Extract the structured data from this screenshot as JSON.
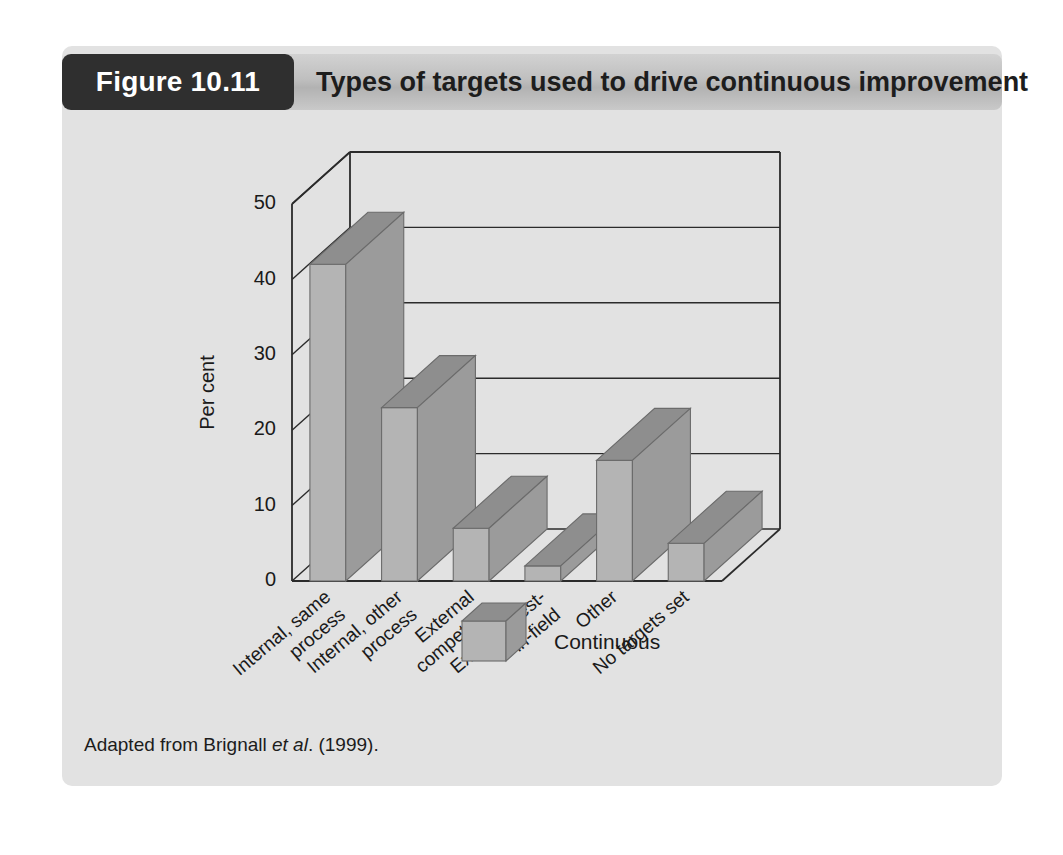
{
  "figure": {
    "badge_label": "Figure 10.11",
    "title": "Types of targets used to drive continuous improvement",
    "source_prefix": "Adapted from Brignall ",
    "source_italic": "et al",
    "source_suffix": ". (1999)."
  },
  "colors": {
    "page_background": "#ffffff",
    "panel_background": "#e2e2e2",
    "badge_background": "#2f2f2f",
    "badge_text": "#ffffff",
    "header_bar": "#c0c0c0",
    "bar_front": "#b4b4b4",
    "bar_top": "#8e8e8e",
    "bar_side": "#9b9b9b",
    "bar_outline": "#6b6b6b",
    "axis_line": "#2b2b2b",
    "gridline": "#2b2b2b",
    "text": "#1a1a1a"
  },
  "chart_data": {
    "type": "bar",
    "title": "Types of targets used to drive continuous improvement",
    "xlabel": "",
    "ylabel": "Per cent",
    "ylim": [
      0,
      50
    ],
    "ytick_step": 10,
    "yticks": [
      "0",
      "10",
      "20",
      "30",
      "40",
      "50"
    ],
    "grid": true,
    "three_d": true,
    "legend_position": "bottom-center",
    "categories": [
      "Internal, same process",
      "Internal, other process",
      "External competitor",
      "External best-in-field",
      "Other",
      "No targets set"
    ],
    "category_lines": [
      [
        "Internal, same",
        "process"
      ],
      [
        "Internal, other",
        "process"
      ],
      [
        "External",
        "competitor"
      ],
      [
        "External best-",
        "in-field"
      ],
      [
        "Other"
      ],
      [
        "No targets set"
      ]
    ],
    "series": [
      {
        "name": "Continuous",
        "values": [
          42,
          23,
          7,
          2,
          16,
          5
        ]
      }
    ]
  },
  "legend": {
    "entries": [
      {
        "label": "Continuous"
      }
    ]
  }
}
